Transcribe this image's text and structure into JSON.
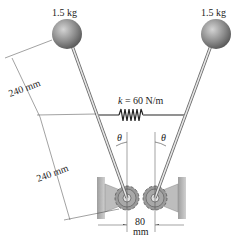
{
  "diagram": {
    "masses": [
      {
        "label": "1.5 kg",
        "side": "left"
      },
      {
        "label": "1.5 kg",
        "side": "right"
      }
    ],
    "spring": {
      "symbol": "k",
      "label": " = 60 N/m"
    },
    "angles": [
      {
        "label": "θ",
        "side": "left"
      },
      {
        "label": "θ",
        "side": "right"
      }
    ],
    "dimensions": {
      "upper_length": "240 mm",
      "lower_length": "240 mm",
      "gear_spacing_value": "80",
      "gear_spacing_unit": "mm"
    },
    "colors": {
      "sphere": "#8a8a8a",
      "rod": "#d9d9d9",
      "support": "#bdbdbd",
      "gear": "#9a9a9a",
      "ink": "#222222"
    }
  }
}
